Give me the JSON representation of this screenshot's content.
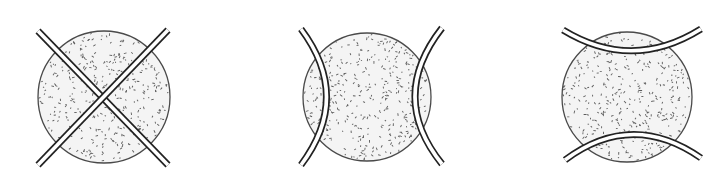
{
  "figure": {
    "description": "Three panels, each a stippled circle overlaid by a pair of double-line bars",
    "colors": {
      "ink": "#222222",
      "circle_outline": "#4a4a4a",
      "circle_fill": "#f4f4f4",
      "stipple": "#5a5a5a",
      "background": "#ffffff"
    },
    "panels": [
      {
        "id": "panel-1",
        "label": "crossed straight bars",
        "bar_shape": "straight-x",
        "bar_count": 2
      },
      {
        "id": "panel-2",
        "label": "side arcs curving inward",
        "bar_shape": "vertical-arcs",
        "bar_count": 2
      },
      {
        "id": "panel-3",
        "label": "top and bottom arcs curving inward",
        "bar_shape": "horizontal-arcs",
        "bar_count": 2
      }
    ]
  }
}
